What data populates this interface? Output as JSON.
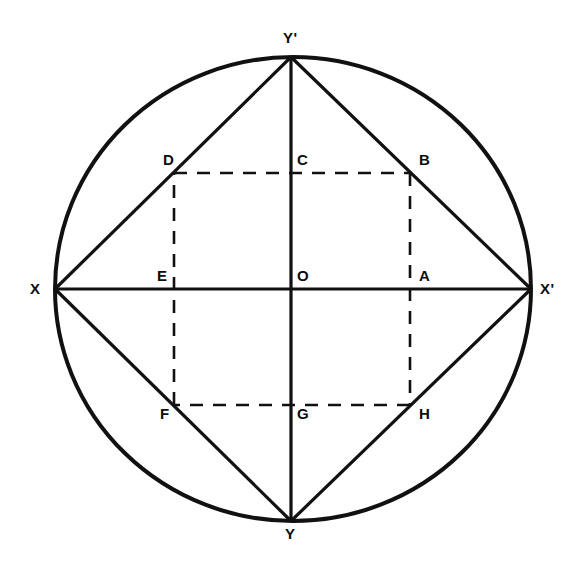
{
  "figure": {
    "background_color": "#ffffff",
    "stroke_color": "#111111",
    "canvas": {
      "width": 587,
      "height": 568
    }
  },
  "geometry": {
    "circle": {
      "cx": 293,
      "cy": 289,
      "rx": 238,
      "ry": 232,
      "stroke_width": 4
    },
    "points": {
      "X": {
        "x": 55,
        "y": 289
      },
      "Xprime": {
        "x": 531,
        "y": 289
      },
      "Yprime": {
        "x": 291,
        "y": 57
      },
      "Y": {
        "x": 291,
        "y": 521
      },
      "O": {
        "x": 291,
        "y": 289
      },
      "A": {
        "x": 410,
        "y": 289
      },
      "B": {
        "x": 410,
        "y": 173
      },
      "C": {
        "x": 291,
        "y": 173
      },
      "D": {
        "x": 174,
        "y": 173
      },
      "E": {
        "x": 174,
        "y": 289
      },
      "F": {
        "x": 174,
        "y": 405
      },
      "G": {
        "x": 291,
        "y": 405
      },
      "H": {
        "x": 410,
        "y": 405
      }
    },
    "solid_segments": [
      {
        "name": "axis-horizontal-X-Xprime",
        "from": "X",
        "to": "Xprime"
      },
      {
        "name": "axis-vertical-Yprime-Y",
        "from": "Yprime",
        "to": "Y"
      },
      {
        "name": "diamond-side-X-Yprime",
        "from": "X",
        "to": "Yprime"
      },
      {
        "name": "diamond-side-Yprime-Xprime",
        "from": "Yprime",
        "to": "Xprime"
      },
      {
        "name": "diamond-side-Xprime-Y",
        "from": "Xprime",
        "to": "Y"
      },
      {
        "name": "diamond-side-Y-X",
        "from": "Y",
        "to": "X"
      }
    ],
    "dashed_segments": [
      {
        "name": "square-side-D-B",
        "from": "D",
        "to": "B"
      },
      {
        "name": "square-side-B-H",
        "from": "B",
        "to": "H"
      },
      {
        "name": "square-side-H-F",
        "from": "H",
        "to": "F"
      },
      {
        "name": "square-side-F-D",
        "from": "F",
        "to": "D"
      }
    ]
  },
  "labels": [
    {
      "id": "Yprime",
      "text": "Y",
      "prime": "'",
      "x": 283,
      "y": 30,
      "name": "point-label-y-prime"
    },
    {
      "id": "X",
      "text": "X",
      "prime": "",
      "x": 30,
      "y": 281,
      "name": "point-label-x"
    },
    {
      "id": "Xprime",
      "text": "X",
      "prime": "'",
      "x": 540,
      "y": 281,
      "name": "point-label-x-prime"
    },
    {
      "id": "Y",
      "text": "Y",
      "prime": "",
      "x": 285,
      "y": 526,
      "name": "point-label-y"
    },
    {
      "id": "D",
      "text": "D",
      "prime": "",
      "x": 163,
      "y": 152,
      "name": "point-label-d"
    },
    {
      "id": "C",
      "text": "C",
      "prime": "",
      "x": 297,
      "y": 152,
      "name": "point-label-c"
    },
    {
      "id": "B",
      "text": "B",
      "prime": "",
      "x": 419,
      "y": 152,
      "name": "point-label-b"
    },
    {
      "id": "E",
      "text": "E",
      "prime": "",
      "x": 157,
      "y": 268,
      "name": "point-label-e"
    },
    {
      "id": "O",
      "text": "O",
      "prime": "",
      "x": 297,
      "y": 268,
      "name": "point-label-o"
    },
    {
      "id": "A",
      "text": "A",
      "prime": "",
      "x": 419,
      "y": 268,
      "name": "point-label-a"
    },
    {
      "id": "F",
      "text": "F",
      "prime": "",
      "x": 160,
      "y": 406,
      "name": "point-label-f"
    },
    {
      "id": "G",
      "text": "G",
      "prime": "",
      "x": 297,
      "y": 406,
      "name": "point-label-g"
    },
    {
      "id": "H",
      "text": "H",
      "prime": "",
      "x": 419,
      "y": 406,
      "name": "point-label-h"
    }
  ]
}
